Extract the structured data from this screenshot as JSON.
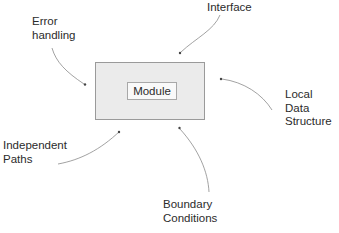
{
  "diagram": {
    "center": {
      "label": "Module"
    },
    "factors": [
      {
        "id": "error-handling",
        "label": "Error\nhandling"
      },
      {
        "id": "interface",
        "label": "Interface"
      },
      {
        "id": "local-data-structure",
        "label": "Local\nData\nStructure"
      },
      {
        "id": "independent-paths",
        "label": "Independent\nPaths"
      },
      {
        "id": "boundary-conditions",
        "label": "Boundary\nConditions"
      }
    ],
    "colors": {
      "outer_box_fill": "#ebebeb",
      "outer_box_border": "#9a9a9a",
      "inner_box_fill": "#f9f9f9",
      "arrow": "#8a8a8a",
      "text": "#2b2b2b"
    }
  }
}
